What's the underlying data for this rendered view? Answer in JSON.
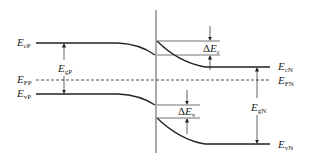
{
  "diagram": {
    "type": "heterojunction energy band diagram",
    "colors": {
      "line": "#222222",
      "junction": "#555555",
      "background": "#ffffff"
    },
    "left_labels": [
      {
        "id": "EcP",
        "main": "E",
        "sub": "cP"
      },
      {
        "id": "EFP",
        "main": "E",
        "sub": "FP"
      },
      {
        "id": "EvP",
        "main": "E",
        "sub": "vP"
      }
    ],
    "right_labels": [
      {
        "id": "EcN",
        "main": "E",
        "sub": "cN"
      },
      {
        "id": "EFN",
        "main": "E",
        "sub": "FN"
      },
      {
        "id": "EvN",
        "main": "E",
        "sub": "vN"
      }
    ],
    "gap_labels": [
      {
        "id": "EgP",
        "main": "E",
        "sub": "gP"
      },
      {
        "id": "EgN",
        "main": "E",
        "sub": "gN"
      }
    ],
    "offset_labels": [
      {
        "id": "dEc",
        "delta": "Δ",
        "main": "E",
        "sub": "c"
      },
      {
        "id": "dEv",
        "delta": "Δ",
        "main": "E",
        "sub": "v"
      }
    ]
  }
}
